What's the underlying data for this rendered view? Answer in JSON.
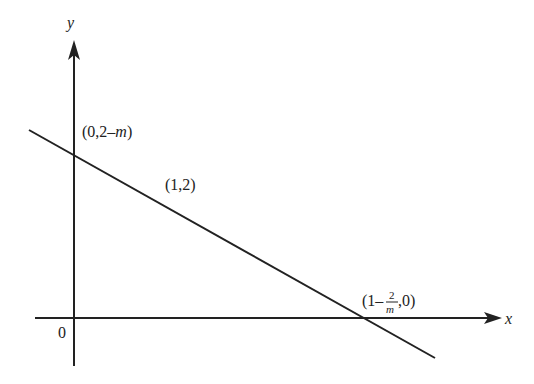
{
  "diagram": {
    "type": "coordinate-graph",
    "axes": {
      "x_label": "x",
      "y_label": "y",
      "origin_label": "0"
    },
    "line": {
      "description": "Straight line with negative slope through three labeled points"
    },
    "points": [
      {
        "id": "y-intercept",
        "label_prefix": "(0,2–",
        "label_var": "m",
        "label_suffix": ")"
      },
      {
        "id": "given-point",
        "label": "(1,2)"
      },
      {
        "id": "x-intercept",
        "label_prefix": "(1–",
        "frac_num": "2",
        "frac_den": "m",
        "label_suffix": ",0)"
      }
    ],
    "colors": {
      "stroke": "#222222",
      "background": "#ffffff"
    }
  }
}
